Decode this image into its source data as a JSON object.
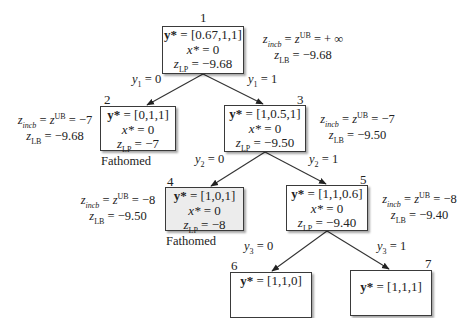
{
  "diagram": {
    "type": "branch-and-bound-tree",
    "nodes": [
      {
        "id": "1",
        "y_star": "[0.67,1,1]",
        "x_star": "0",
        "z_lp": "−9.68",
        "status": "",
        "annotation": {
          "z_incb": "+ ∞",
          "z_lb": "−9.68"
        }
      },
      {
        "id": "2",
        "y_star": "[0,1,1]",
        "x_star": "0",
        "z_lp": "−7",
        "status": "Fathomed",
        "annotation": {
          "z_incb": "−7",
          "z_lb": "−9.68"
        }
      },
      {
        "id": "3",
        "y_star": "[1,0.5,1]",
        "x_star": "0",
        "z_lp": "−9.50",
        "status": "",
        "annotation": {
          "z_incb": "−7",
          "z_lb": "−9.50"
        }
      },
      {
        "id": "4",
        "y_star": "[1,0,1]",
        "x_star": "0",
        "z_lp": "−8",
        "status": "Fathomed",
        "annotation": {
          "z_incb": "−8",
          "z_lb": "−9.50"
        }
      },
      {
        "id": "5",
        "y_star": "[1,1,0.6]",
        "x_star": "0",
        "z_lp": "−9.40",
        "status": "",
        "annotation": {
          "z_incb": "−8",
          "z_lb": "−9.40"
        }
      },
      {
        "id": "6",
        "y_star": "[1,1,0]",
        "x_star": "",
        "z_lp": "",
        "status": "",
        "annotation": null
      },
      {
        "id": "7",
        "y_star": "[1,1,1]",
        "x_star": "",
        "z_lp": "",
        "status": "",
        "annotation": null
      }
    ],
    "edges": [
      {
        "from": "1",
        "to": "2",
        "var": "1",
        "value": "0"
      },
      {
        "from": "1",
        "to": "3",
        "var": "1",
        "value": "1"
      },
      {
        "from": "3",
        "to": "4",
        "var": "2",
        "value": "0"
      },
      {
        "from": "3",
        "to": "5",
        "var": "2",
        "value": "1"
      },
      {
        "from": "5",
        "to": "6",
        "var": "3",
        "value": "0"
      },
      {
        "from": "5",
        "to": "7",
        "var": "3",
        "value": "1"
      }
    ],
    "labels": {
      "y_symbol": "y*",
      "x_symbol": "x*",
      "z_symbol": "z",
      "lp_sub": "LP",
      "incb_sub": "incb",
      "ub_sup": "UB",
      "lb_sub": "LB",
      "eq": " = ",
      "y_var": "y"
    }
  }
}
